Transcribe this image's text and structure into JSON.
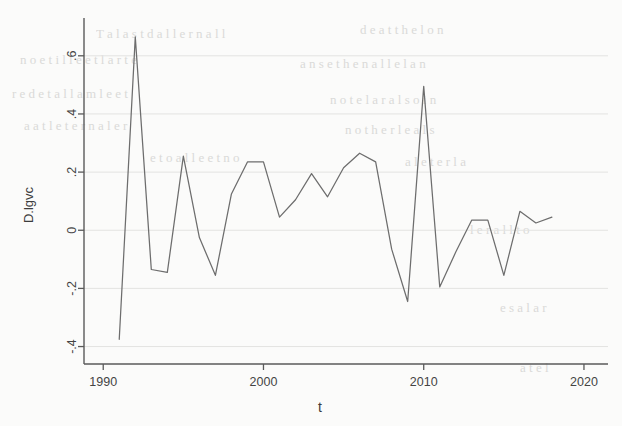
{
  "figure": {
    "background_color": "#fbfbfa",
    "line_color": "#6d6d6d",
    "axis_color": "#5a5a5a",
    "grid_color": "#e3e3e1"
  },
  "background_bleed": [
    {
      "text": "T a l a s t d   a l l e r   n a l l",
      "x": 96,
      "y": 26,
      "size": 13
    },
    {
      "text": "d e   a t   t h e   l o n",
      "x": 360,
      "y": 22,
      "size": 13
    },
    {
      "text": "n o   e t   i l l e   e t   l a r t e",
      "x": 20,
      "y": 52,
      "size": 13
    },
    {
      "text": "a n   s e   t h e   n a   l l e   l a n",
      "x": 300,
      "y": 56,
      "size": 13
    },
    {
      "text": "r e   d e   t a l   l a   m l e   e t",
      "x": 12,
      "y": 86,
      "size": 13
    },
    {
      "text": "n o t e   l a r   a l s o   i n",
      "x": 330,
      "y": 92,
      "size": 13
    },
    {
      "text": "a   a t   l e   t e r   n a   l e r",
      "x": 24,
      "y": 118,
      "size": 13
    },
    {
      "text": "n o   t h e r   l e   a l s",
      "x": 345,
      "y": 122,
      "size": 13
    },
    {
      "text": "e   t o   a   l l e   e t   n o",
      "x": 150,
      "y": 150,
      "size": 13
    },
    {
      "text": "a l   e t   e r   l a",
      "x": 405,
      "y": 154,
      "size": 13
    },
    {
      "text": "l e r   a l l   t o",
      "x": 470,
      "y": 222,
      "size": 13
    },
    {
      "text": "e s   a   l a r",
      "x": 500,
      "y": 300,
      "size": 13
    },
    {
      "text": "a   t e   l",
      "x": 520,
      "y": 360,
      "size": 13
    }
  ],
  "chart_data": {
    "type": "line",
    "title": "",
    "xlabel": "t",
    "ylabel": "D.lgvc",
    "xlim": [
      1988.8,
      2021.5
    ],
    "ylim": [
      -0.46,
      0.73
    ],
    "xticks": [
      1990,
      2000,
      2010,
      2020
    ],
    "xticklabels": [
      "1990",
      "2000",
      "2010",
      "2020"
    ],
    "yticks": [
      -0.4,
      -0.2,
      0,
      0.2,
      0.4,
      0.6
    ],
    "yticklabels": [
      "-.4",
      "-.2",
      "0",
      ".2",
      ".4",
      ".6"
    ],
    "grid": "horizontal-faint",
    "legend": "none",
    "series": [
      {
        "name": "D.lgvc",
        "x": [
          1991,
          1992,
          1993,
          1994,
          1995,
          1996,
          1997,
          1998,
          1999,
          2000,
          2001,
          2002,
          2003,
          2004,
          2005,
          2006,
          2007,
          2008,
          2009,
          2010,
          2011,
          2012,
          2013,
          2014,
          2015,
          2016,
          2017,
          2018
        ],
        "y": [
          -0.375,
          0.665,
          -0.135,
          -0.145,
          0.255,
          -0.025,
          -0.155,
          0.125,
          0.235,
          0.235,
          0.045,
          0.105,
          0.195,
          0.115,
          0.215,
          0.265,
          0.235,
          -0.065,
          -0.245,
          0.495,
          -0.195,
          -0.075,
          0.035,
          0.035,
          -0.155,
          0.065,
          0.025,
          0.045
        ]
      }
    ]
  }
}
